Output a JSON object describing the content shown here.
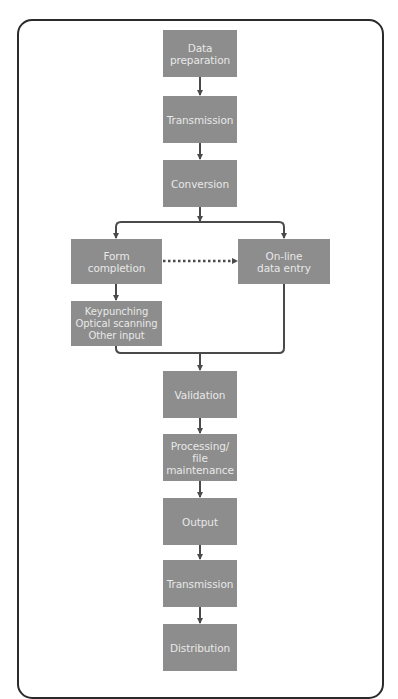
{
  "diagram": {
    "type": "flowchart",
    "colors": {
      "box_fill": "#8d8d8d",
      "box_text": "#e8e8e8",
      "connector": "#4a4a4a",
      "frame": "#2a2a2a"
    },
    "nodes": [
      {
        "id": "data-preparation",
        "label": "Data\npreparation"
      },
      {
        "id": "transmission-1",
        "label": "Transmission"
      },
      {
        "id": "conversion",
        "label": "Conversion"
      },
      {
        "id": "form-completion",
        "label": "Form\ncompletion"
      },
      {
        "id": "online-data-entry",
        "label": "On-line\ndata entry"
      },
      {
        "id": "input-methods",
        "label": "Keypunching\nOptical scanning\nOther input"
      },
      {
        "id": "validation",
        "label": "Validation"
      },
      {
        "id": "processing",
        "label": "Processing/\nfile\nmaintenance"
      },
      {
        "id": "output",
        "label": "Output"
      },
      {
        "id": "transmission-2",
        "label": "Transmission"
      },
      {
        "id": "distribution",
        "label": "Distribution"
      }
    ],
    "edges": [
      {
        "from": "data-preparation",
        "to": "transmission-1",
        "style": "solid"
      },
      {
        "from": "transmission-1",
        "to": "conversion",
        "style": "solid"
      },
      {
        "from": "conversion",
        "to": "form-completion",
        "style": "solid"
      },
      {
        "from": "conversion",
        "to": "online-data-entry",
        "style": "solid"
      },
      {
        "from": "form-completion",
        "to": "online-data-entry",
        "style": "dotted"
      },
      {
        "from": "form-completion",
        "to": "input-methods",
        "style": "solid"
      },
      {
        "from": "input-methods",
        "to": "validation",
        "style": "solid"
      },
      {
        "from": "online-data-entry",
        "to": "validation",
        "style": "solid"
      },
      {
        "from": "validation",
        "to": "processing",
        "style": "solid"
      },
      {
        "from": "processing",
        "to": "output",
        "style": "solid"
      },
      {
        "from": "output",
        "to": "transmission-2",
        "style": "solid"
      },
      {
        "from": "transmission-2",
        "to": "distribution",
        "style": "solid"
      }
    ]
  }
}
